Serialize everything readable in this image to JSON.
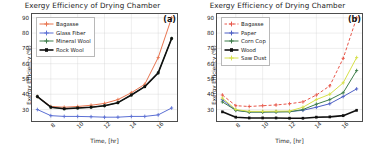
{
  "chart_data": [
    {
      "type": "line",
      "panel": "(a)",
      "title": "Exergy Efficiency of Drying Chamber",
      "xlabel": "Time, [hr]",
      "ylabel": "Exergy Efficiency (%)",
      "xlim": [
        6.6,
        17.4
      ],
      "ylim": [
        22.5,
        92.5
      ],
      "xticks": [
        8,
        10,
        12,
        14,
        16
      ],
      "yticks": [
        30,
        40,
        50,
        60,
        70,
        80,
        90
      ],
      "grid": true,
      "legend_position": "upper-left",
      "x": [
        7,
        8,
        9,
        10,
        11,
        12,
        13,
        14,
        15,
        16,
        17
      ],
      "series": [
        {
          "name": "Bagasse",
          "color": "#e8744f",
          "style": "solid",
          "marker": "plus",
          "values": [
            38.5,
            32.0,
            31.5,
            32.0,
            32.8,
            34.0,
            36.5,
            41.0,
            46.5,
            64.0,
            90.0
          ]
        },
        {
          "name": "Glass Fiber",
          "color": "#5b6fd4",
          "style": "solid",
          "marker": "plus",
          "values": [
            30.0,
            26.0,
            25.5,
            25.5,
            25.3,
            25.0,
            25.0,
            25.5,
            25.5,
            26.5,
            31.0
          ]
        },
        {
          "name": "Mineral Wool",
          "color": "#3d7d4a",
          "style": "solid",
          "marker": "plus",
          "values": [
            38.5,
            31.5,
            30.5,
            31.0,
            31.5,
            32.5,
            34.5,
            39.5,
            45.0,
            54.0,
            76.5
          ]
        },
        {
          "name": "Rock Wool",
          "color": "#101010",
          "style": "solid",
          "marker": "square",
          "values": [
            38.5,
            31.5,
            30.5,
            31.0,
            31.5,
            32.5,
            34.5,
            39.5,
            45.0,
            54.0,
            76.5
          ]
        }
      ]
    },
    {
      "type": "line",
      "panel": "(b)",
      "title": "Exergy Efficiency of Drying Chamber",
      "xlabel": "Time, [hr]",
      "ylabel": "Exergy Efficiency (%)",
      "xlim": [
        6.6,
        17.4
      ],
      "ylim": [
        22.5,
        92.5
      ],
      "xticks": [
        8,
        10,
        12,
        14,
        16
      ],
      "yticks": [
        30,
        40,
        50,
        60,
        70,
        80,
        90
      ],
      "grid": true,
      "legend_position": "upper-left",
      "x": [
        7,
        8,
        9,
        10,
        11,
        12,
        13,
        14,
        15,
        16,
        17
      ],
      "series": [
        {
          "name": "Bagasse",
          "color": "#e8574a",
          "style": "dashed",
          "marker": "plus",
          "values": [
            39.5,
            32.5,
            32.0,
            32.5,
            33.0,
            33.8,
            35.0,
            39.5,
            45.5,
            63.5,
            90.0
          ]
        },
        {
          "name": "Paper",
          "color": "#4d5fc4",
          "style": "solid",
          "marker": "plus",
          "values": [
            36.5,
            29.5,
            28.5,
            28.5,
            28.6,
            28.7,
            29.5,
            31.5,
            33.8,
            38.5,
            43.5
          ]
        },
        {
          "name": "Corn Cop",
          "color": "#3d7d4a",
          "style": "solid",
          "marker": "plus",
          "values": [
            35.0,
            29.5,
            28.3,
            28.3,
            28.4,
            28.5,
            30.0,
            33.5,
            36.5,
            41.0,
            55.5
          ]
        },
        {
          "name": "Wood",
          "color": "#101010",
          "style": "solid",
          "marker": "square",
          "values": [
            28.5,
            25.0,
            24.5,
            24.5,
            24.5,
            24.3,
            24.3,
            25.0,
            25.2,
            26.0,
            29.5
          ]
        },
        {
          "name": "Saw Dust",
          "color": "#d6e04a",
          "style": "solid",
          "marker": "plus",
          "values": [
            37.5,
            30.0,
            28.8,
            28.8,
            28.9,
            29.0,
            31.5,
            36.5,
            40.0,
            47.5,
            64.0
          ]
        }
      ]
    }
  ]
}
